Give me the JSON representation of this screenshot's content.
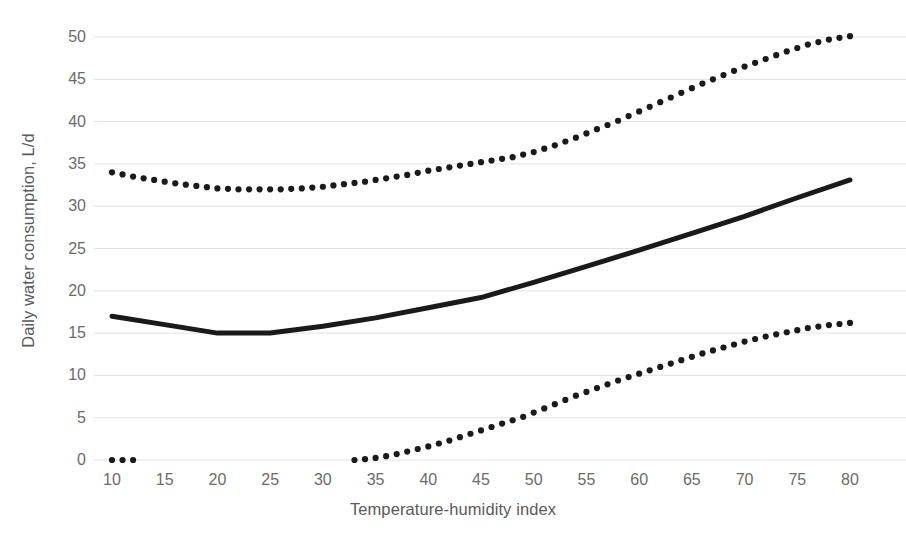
{
  "chart_data": {
    "type": "line",
    "title": "",
    "xlabel": "Temperature-humidity index",
    "ylabel": "Daily water consumption, L/d",
    "xlim": [
      10,
      80
    ],
    "ylim": [
      0,
      50
    ],
    "xticks": [
      10,
      15,
      20,
      25,
      30,
      35,
      40,
      45,
      50,
      55,
      60,
      65,
      70,
      75,
      80
    ],
    "yticks": [
      0,
      5,
      10,
      15,
      20,
      25,
      30,
      35,
      40,
      45,
      50
    ],
    "grid": "horizontal",
    "legend": "none",
    "series": [
      {
        "name": "upper-dotted",
        "style": "dotted",
        "color": "#1a1a1a",
        "x": [
          10,
          12,
          14,
          16,
          18,
          20,
          22,
          24,
          26,
          28,
          30,
          32,
          34,
          36,
          38,
          40,
          42,
          44,
          46,
          48,
          50,
          52,
          54,
          56,
          58,
          60,
          62,
          64,
          66,
          68,
          70,
          72,
          74,
          76,
          78,
          80
        ],
        "values": [
          34.0,
          33.5,
          33.1,
          32.7,
          32.4,
          32.1,
          32.0,
          32.0,
          32.0,
          32.1,
          32.3,
          32.6,
          32.9,
          33.3,
          33.7,
          34.2,
          34.6,
          35.0,
          35.4,
          35.8,
          36.4,
          37.2,
          38.1,
          39.1,
          40.1,
          41.2,
          42.3,
          43.4,
          44.5,
          45.5,
          46.5,
          47.4,
          48.3,
          49.1,
          49.7,
          50.1
        ]
      },
      {
        "name": "solid-mean",
        "style": "solid",
        "color": "#1a1a1a",
        "x": [
          10,
          15,
          20,
          25,
          30,
          35,
          40,
          45,
          50,
          55,
          60,
          65,
          70,
          75,
          80
        ],
        "values": [
          17.0,
          16.0,
          15.0,
          15.0,
          15.8,
          16.8,
          18.0,
          19.2,
          21.0,
          22.9,
          24.8,
          26.8,
          28.8,
          31.0,
          33.1
        ]
      },
      {
        "name": "lower-dotted",
        "style": "dotted",
        "color": "#1a1a1a",
        "x": [
          33,
          34,
          35,
          36,
          37,
          38,
          39,
          40,
          41,
          42,
          43,
          44,
          45,
          46,
          47,
          48,
          49,
          50,
          52,
          54,
          56,
          58,
          60,
          62,
          64,
          66,
          68,
          70,
          72,
          74,
          76,
          78,
          80
        ],
        "values": [
          0.0,
          0.1,
          0.25,
          0.45,
          0.7,
          1.0,
          1.3,
          1.6,
          1.95,
          2.3,
          2.7,
          3.1,
          3.5,
          3.9,
          4.3,
          4.7,
          5.1,
          5.6,
          6.6,
          7.6,
          8.5,
          9.4,
          10.2,
          11.0,
          11.8,
          12.6,
          13.3,
          14.0,
          14.6,
          15.1,
          15.6,
          15.95,
          16.2
        ]
      },
      {
        "name": "lower-dotted-left-fragment",
        "style": "dotted",
        "color": "#1a1a1a",
        "x": [
          10,
          11,
          12
        ],
        "values": [
          0.0,
          0.0,
          0.0
        ]
      }
    ]
  },
  "caption": {
    "partial_text": ""
  }
}
